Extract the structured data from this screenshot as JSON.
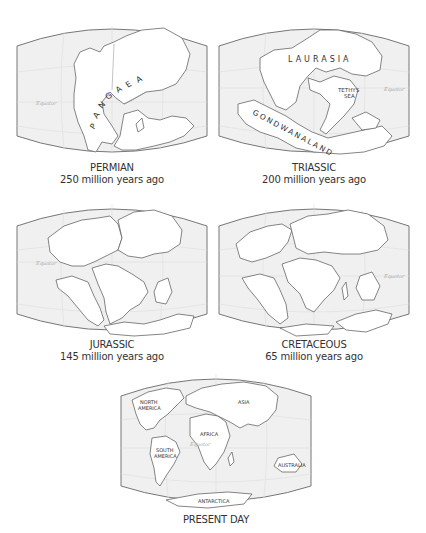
{
  "colors": {
    "ocean": "#f0f0f0",
    "land": "#ffffff",
    "outline": "#666666",
    "grid": "#dedede",
    "text": "#333333",
    "equator_label": "#aaaaaa"
  },
  "panels": [
    {
      "id": "permian",
      "era": "PERMIAN",
      "age": "250 million years ago",
      "equator_label": "Equator",
      "map_labels": [
        "P",
        "A",
        "N",
        "G",
        "A",
        "E",
        "A"
      ],
      "supercontinent": "PANGAEA"
    },
    {
      "id": "triassic",
      "era": "TRIASSIC",
      "age": "200 million years ago",
      "equator_label": "Equator",
      "map_labels": {
        "north": "LAURASIA",
        "south": "GONDWANALAND",
        "sea_line1": "TETHYS",
        "sea_line2": "SEA"
      }
    },
    {
      "id": "jurassic",
      "era": "JURASSIC",
      "age": "145 million years ago",
      "equator_label": "Equator"
    },
    {
      "id": "cretaceous",
      "era": "CRETACEOUS",
      "age": "65 million years ago",
      "equator_label": "Equator"
    },
    {
      "id": "present",
      "era": "PRESENT DAY",
      "equator_label": "Equator",
      "map_labels": {
        "north_america_1": "NORTH",
        "north_america_2": "AMERICA",
        "south_america_1": "SOUTH",
        "south_america_2": "AMERICA",
        "africa": "AFRICA",
        "asia": "ASIA",
        "australia": "AUSTRALIA",
        "antarctica": "ANTARCTICA"
      }
    }
  ]
}
